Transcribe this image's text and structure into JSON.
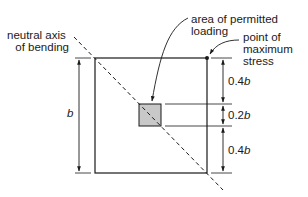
{
  "diagram": {
    "labels": {
      "neutral_axis_line1": "neutral axis",
      "neutral_axis_line2": "of bending",
      "area_line1": "area of permitted",
      "area_line2": "loading",
      "point_line1": "point of",
      "point_line2": "maximum",
      "point_line3": "stress",
      "side": "b",
      "dim_top_num": "0.4",
      "dim_mid_num": "0.2",
      "dim_bot_num": "0.4",
      "dim_var": "b"
    },
    "colors": {
      "line": "#1a1a1a",
      "fill_area": "#c8c8c8"
    }
  }
}
